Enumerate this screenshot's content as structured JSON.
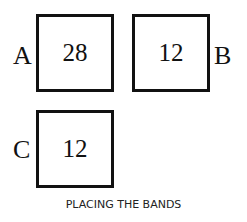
{
  "boxes": [
    {
      "id": "A",
      "letter": "A",
      "value": "28"
    },
    {
      "id": "B",
      "letter": "B",
      "value": "12"
    },
    {
      "id": "C",
      "letter": "C",
      "value": "12"
    }
  ],
  "caption": "PLACING THE BANDS"
}
